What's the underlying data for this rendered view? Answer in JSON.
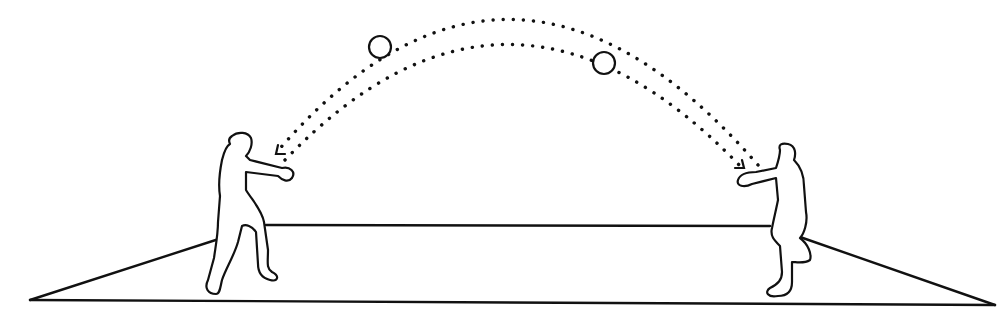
{
  "illustration": {
    "subject": "two players throwing a ball back and forth across a court",
    "colors": {
      "ink": "#111111",
      "background": "#ffffff"
    },
    "court": {
      "back_line": {
        "x1": 266,
        "y1": 225,
        "x2": 770,
        "y2": 226
      },
      "left_edge": {
        "x1": 30,
        "y1": 300,
        "x2": 225,
        "y2": 237
      },
      "right_edge": {
        "x1": 800,
        "y1": 237,
        "x2": 995,
        "y2": 305
      },
      "front_line": {
        "x1": 30,
        "y1": 300,
        "x2": 995,
        "y2": 305
      }
    },
    "trajectories": [
      {
        "name": "outer-arc",
        "direction": "right-to-left",
        "start": [
          758,
          165
        ],
        "control": [
          510,
          -120
        ],
        "end": [
          276,
          153
        ],
        "arrow_at": "end"
      },
      {
        "name": "inner-arc",
        "direction": "left-to-right",
        "start": [
          285,
          160
        ],
        "control": [
          510,
          -75
        ],
        "end": [
          742,
          168
        ],
        "arrow_at": "end"
      }
    ],
    "balls": [
      {
        "cx": 380,
        "cy": 47,
        "r": 11
      },
      {
        "cx": 604,
        "cy": 63,
        "r": 11
      }
    ],
    "players": [
      {
        "name": "left-player",
        "facing": "right"
      },
      {
        "name": "right-player",
        "facing": "left"
      }
    ]
  }
}
